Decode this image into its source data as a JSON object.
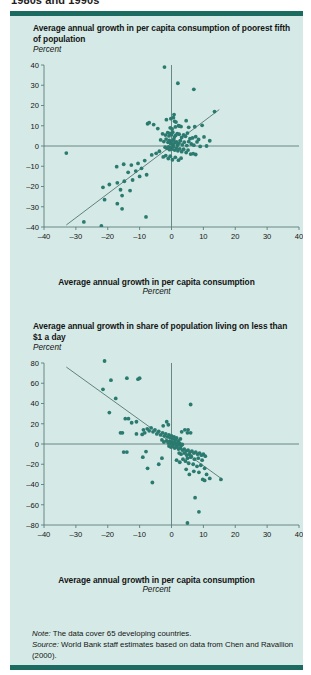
{
  "figure": {
    "caption_cut": "1980s and 1990s",
    "rule_color": "#1c6b60",
    "panel_bg": "#d5eae6",
    "point_color": "#2b7a70",
    "axis_color": "#5a7d7a"
  },
  "charts": [
    {
      "id": "chart1",
      "title": "Average annual growth in per capita consumption of poorest fifth of population",
      "unit": "Percent",
      "xaxis_label": "Average annual growth in per capita consumption",
      "xaxis_unit": "Percent"
    },
    {
      "id": "chart2",
      "title": "Average annual growth in share of population living on less than $1 a day",
      "unit": "Percent",
      "xaxis_label": "Average annual growth in per capita consumption",
      "xaxis_unit": "Percent"
    }
  ],
  "notes": {
    "note_label": "Note:",
    "note_text": " The data cover 65 developing countries.",
    "source_label": "Source:",
    "source_text": " World Bank staff estimates based on data from Chen and Ravallion (2000)."
  },
  "chart_data": [
    {
      "type": "scatter",
      "title": "Average annual growth in per capita consumption of poorest fifth of population",
      "xlabel": "Average annual growth in per capita consumption",
      "ylabel": "Percent",
      "xunit": "Percent",
      "yunit": "Percent",
      "xlim": [
        -40,
        40
      ],
      "ylim": [
        -40,
        40
      ],
      "xticks": [
        -40,
        -30,
        -20,
        -10,
        0,
        10,
        20,
        30,
        40
      ],
      "yticks": [
        -40,
        -30,
        -20,
        -10,
        0,
        10,
        20,
        30,
        40
      ],
      "xticklabels": [
        "–40",
        "–30",
        "–20",
        "–10",
        "0",
        "10",
        "20",
        "30",
        "40"
      ],
      "yticklabels": [
        "–40",
        "–30",
        "–20",
        "–10",
        "0",
        "10",
        "20",
        "30",
        "40"
      ],
      "grid": false,
      "legend": null,
      "zero_lines": true,
      "fit_line": {
        "x": [
          -33,
          15
        ],
        "y": [
          -39,
          18
        ],
        "slope": 1.19,
        "intercept": -0.2
      },
      "points": [
        [
          -2.2,
          39
        ],
        [
          2.0,
          31
        ],
        [
          7.0,
          28
        ],
        [
          13.5,
          17
        ],
        [
          -7.5,
          11
        ],
        [
          -7.0,
          11.5
        ],
        [
          -1.6,
          13
        ],
        [
          -0.2,
          13.5
        ],
        [
          0.6,
          14
        ],
        [
          0.8,
          15.5
        ],
        [
          1.0,
          12.2
        ],
        [
          1.4,
          11.8
        ],
        [
          4.6,
          12.5
        ],
        [
          2.2,
          10.0
        ],
        [
          -4.3,
          8.6
        ],
        [
          -5.6,
          10.6
        ],
        [
          -0.4,
          9.0
        ],
        [
          0.2,
          8.4
        ],
        [
          1.2,
          9.4
        ],
        [
          2.6,
          9.8
        ],
        [
          3.0,
          9.6
        ],
        [
          5.4,
          9.2
        ],
        [
          7.3,
          9.5
        ],
        [
          9.6,
          10.2
        ],
        [
          -2.8,
          6.0
        ],
        [
          -1.9,
          5.4
        ],
        [
          -1.2,
          6.6
        ],
        [
          -0.8,
          5.0
        ],
        [
          -0.5,
          6.2
        ],
        [
          0.0,
          5.6
        ],
        [
          0.4,
          6.8
        ],
        [
          0.9,
          4.4
        ],
        [
          1.3,
          5.2
        ],
        [
          1.8,
          6.1
        ],
        [
          2.4,
          5.8
        ],
        [
          3.2,
          4.2
        ],
        [
          3.8,
          5.5
        ],
        [
          4.4,
          4.8
        ],
        [
          5.0,
          6.4
        ],
        [
          5.8,
          3.6
        ],
        [
          6.6,
          4.0
        ],
        [
          7.6,
          4.6
        ],
        [
          8.5,
          3.2
        ],
        [
          10.2,
          4.5
        ],
        [
          12.0,
          2.6
        ],
        [
          -3.4,
          3.0
        ],
        [
          -2.4,
          2.2
        ],
        [
          -1.7,
          3.4
        ],
        [
          -1.1,
          1.8
        ],
        [
          -0.7,
          2.8
        ],
        [
          -0.3,
          1.2
        ],
        [
          0.1,
          2.4
        ],
        [
          0.5,
          0.8
        ],
        [
          0.7,
          3.2
        ],
        [
          1.1,
          1.6
        ],
        [
          1.5,
          2.0
        ],
        [
          1.9,
          0.4
        ],
        [
          2.3,
          1.4
        ],
        [
          2.8,
          2.6
        ],
        [
          3.4,
          0.6
        ],
        [
          4.0,
          1.9
        ],
        [
          4.8,
          0.2
        ],
        [
          5.4,
          2.2
        ],
        [
          6.2,
          1.0
        ],
        [
          7.0,
          0.4
        ],
        [
          8.0,
          2.0
        ],
        [
          9.0,
          -0.2
        ],
        [
          11.0,
          0.0
        ],
        [
          -2.0,
          -0.6
        ],
        [
          -1.4,
          -1.2
        ],
        [
          -0.9,
          -0.4
        ],
        [
          -0.6,
          -1.8
        ],
        [
          -0.2,
          -0.8
        ],
        [
          0.2,
          -1.5
        ],
        [
          0.6,
          -0.3
        ],
        [
          1.0,
          -2.0
        ],
        [
          1.6,
          -1.0
        ],
        [
          2.0,
          -2.4
        ],
        [
          2.6,
          -1.4
        ],
        [
          3.2,
          -2.8
        ],
        [
          3.8,
          -1.6
        ],
        [
          4.6,
          -3.2
        ],
        [
          5.2,
          -2.0
        ],
        [
          6.0,
          -4.0
        ],
        [
          6.8,
          -3.8
        ],
        [
          7.6,
          -4.2
        ],
        [
          -3.8,
          -2.6
        ],
        [
          -4.8,
          -3.6
        ],
        [
          -6.2,
          -4.4
        ],
        [
          -33.0,
          -3.5
        ],
        [
          -2.6,
          -5.4
        ],
        [
          -1.8,
          -4.8
        ],
        [
          -1.0,
          -6.2
        ],
        [
          -0.4,
          -5.0
        ],
        [
          0.3,
          -6.8
        ],
        [
          1.2,
          -5.6
        ],
        [
          2.2,
          -7.0
        ],
        [
          3.0,
          -6.0
        ],
        [
          -8.4,
          -7.2
        ],
        [
          -10.5,
          -8.6
        ],
        [
          -12.6,
          -9.4
        ],
        [
          -15.0,
          -9.0
        ],
        [
          -17.2,
          -10.2
        ],
        [
          -9.4,
          -11.0
        ],
        [
          -11.2,
          -12.4
        ],
        [
          -13.6,
          -13.0
        ],
        [
          -7.8,
          -14.2
        ],
        [
          -10.0,
          -15.0
        ],
        [
          -12.2,
          -16.8
        ],
        [
          -14.8,
          -17.4
        ],
        [
          -17.0,
          -18.2
        ],
        [
          -19.5,
          -19.0
        ],
        [
          -21.5,
          -20.4
        ],
        [
          -16.0,
          -21.6
        ],
        [
          -13.0,
          -22.0
        ],
        [
          -15.5,
          -24.5
        ],
        [
          -21.0,
          -26.5
        ],
        [
          -17.0,
          -28.5
        ],
        [
          -15.5,
          -31.0
        ],
        [
          -8.0,
          -35.0
        ],
        [
          -27.5,
          -37.5
        ],
        [
          -22.0,
          -39.5
        ]
      ]
    },
    {
      "type": "scatter",
      "title": "Average annual growth in share of population living on less than $1 a day",
      "xlabel": "Average annual growth in per capita consumption",
      "ylabel": "Percent",
      "xunit": "Percent",
      "yunit": "Percent",
      "xlim": [
        -40,
        40
      ],
      "ylim": [
        -80,
        80
      ],
      "xticks": [
        -40,
        -30,
        -20,
        -10,
        0,
        10,
        20,
        30,
        40
      ],
      "yticks": [
        -80,
        -60,
        -40,
        -20,
        0,
        20,
        40,
        60,
        80
      ],
      "xticklabels": [
        "–40",
        "–30",
        "–20",
        "–10",
        "0",
        "10",
        "20",
        "30",
        "40"
      ],
      "yticklabels": [
        "–80",
        "–60",
        "–40",
        "–20",
        "0",
        "20",
        "40",
        "60",
        "80"
      ],
      "grid": false,
      "legend": null,
      "zero_lines": true,
      "fit_line": {
        "x": [
          -33,
          16
        ],
        "y": [
          76,
          -35
        ],
        "slope": -2.27,
        "intercept": 0.8
      },
      "points": [
        [
          -21.0,
          82
        ],
        [
          -14.0,
          65
        ],
        [
          -19.0,
          63
        ],
        [
          -10.5,
          64
        ],
        [
          -10.0,
          65
        ],
        [
          -21.5,
          54
        ],
        [
          -17.5,
          45
        ],
        [
          -19.5,
          31
        ],
        [
          -14.5,
          25
        ],
        [
          -13.5,
          25
        ],
        [
          -12.5,
          21
        ],
        [
          -11.0,
          22
        ],
        [
          -1.5,
          22
        ],
        [
          6.0,
          39
        ],
        [
          -16.0,
          11
        ],
        [
          -15.4,
          11
        ],
        [
          -11.0,
          10
        ],
        [
          -9.2,
          9.5
        ],
        [
          -8.4,
          11
        ],
        [
          -8.8,
          14
        ],
        [
          -7.6,
          15
        ],
        [
          -7.0,
          13
        ],
        [
          -6.4,
          16
        ],
        [
          -5.8,
          12
        ],
        [
          -5.2,
          14
        ],
        [
          -4.6,
          10
        ],
        [
          -4.0,
          12.5
        ],
        [
          -3.4,
          9
        ],
        [
          -2.8,
          11
        ],
        [
          -2.2,
          8
        ],
        [
          -1.8,
          10
        ],
        [
          -1.2,
          7
        ],
        [
          -0.8,
          9
        ],
        [
          -0.4,
          6
        ],
        [
          0.0,
          8
        ],
        [
          0.4,
          5
        ],
        [
          0.8,
          7
        ],
        [
          1.2,
          4
        ],
        [
          1.6,
          6
        ],
        [
          2.2,
          3
        ],
        [
          2.8,
          5
        ],
        [
          -2.6,
          18
        ],
        [
          -1.0,
          19
        ],
        [
          3.2,
          12
        ],
        [
          5.0,
          11
        ],
        [
          6.0,
          11
        ],
        [
          4.2,
          14
        ],
        [
          5.2,
          14
        ],
        [
          -3.0,
          4
        ],
        [
          -2.4,
          2
        ],
        [
          -1.6,
          3
        ],
        [
          -1.0,
          1
        ],
        [
          -0.6,
          2.5
        ],
        [
          -0.2,
          0.5
        ],
        [
          0.2,
          2
        ],
        [
          0.6,
          0
        ],
        [
          1.0,
          1.5
        ],
        [
          1.4,
          -0.5
        ],
        [
          1.8,
          1.0
        ],
        [
          2.2,
          -1.0
        ],
        [
          2.6,
          0.5
        ],
        [
          3.0,
          -1.5
        ],
        [
          3.4,
          -0.5
        ],
        [
          -0.8,
          -2
        ],
        [
          -0.2,
          -3
        ],
        [
          0.4,
          -2.5
        ],
        [
          1.0,
          -4
        ],
        [
          1.6,
          -3
        ],
        [
          2.2,
          -5
        ],
        [
          2.8,
          -4
        ],
        [
          3.4,
          -6
        ],
        [
          4.0,
          -5
        ],
        [
          4.6,
          -7
        ],
        [
          5.2,
          -6
        ],
        [
          5.8,
          -8
        ],
        [
          6.4,
          -7
        ],
        [
          7.0,
          -9
        ],
        [
          7.6,
          -8
        ],
        [
          8.2,
          -10
        ],
        [
          8.8,
          -9
        ],
        [
          9.4,
          -11
        ],
        [
          10.0,
          -10
        ],
        [
          10.6,
          -12
        ],
        [
          4.0,
          -9
        ],
        [
          4.8,
          -11
        ],
        [
          5.6,
          -10
        ],
        [
          6.2,
          -12
        ],
        [
          3.0,
          -10
        ],
        [
          2.4,
          -9
        ],
        [
          -8.0,
          -7.5
        ],
        [
          -14.0,
          -8
        ],
        [
          -15.0,
          -8
        ],
        [
          5.0,
          -14
        ],
        [
          6.0,
          -13
        ],
        [
          7.2,
          -15
        ],
        [
          8.4,
          -14
        ],
        [
          9.6,
          -16
        ],
        [
          3.6,
          -15
        ],
        [
          4.4,
          -17
        ],
        [
          2.6,
          -18
        ],
        [
          1.6,
          -16
        ],
        [
          -9.0,
          -13
        ],
        [
          -7.5,
          -24
        ],
        [
          -6.0,
          -38
        ],
        [
          -4.0,
          -20
        ],
        [
          5.4,
          -19
        ],
        [
          6.8,
          -20
        ],
        [
          8.0,
          -22
        ],
        [
          9.2,
          -21
        ],
        [
          10.4,
          -24
        ],
        [
          7.0,
          -27
        ],
        [
          8.6,
          -28
        ],
        [
          11.0,
          -30
        ],
        [
          12.0,
          -34
        ],
        [
          15.5,
          -35
        ],
        [
          4.6,
          -25
        ],
        [
          5.6,
          -30
        ],
        [
          9.8,
          -35
        ],
        [
          10.4,
          -36
        ],
        [
          7.4,
          -53
        ],
        [
          8.6,
          -67
        ],
        [
          5.0,
          -78
        ],
        [
          -3.0,
          -14
        ]
      ]
    }
  ]
}
